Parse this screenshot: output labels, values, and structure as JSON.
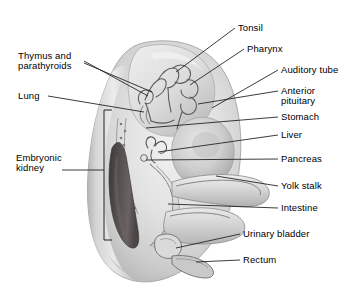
{
  "figure": {
    "background_color": "#ffffff",
    "body_fill_light": "#e8e8e8",
    "body_fill_mid": "#c8c8c8",
    "body_fill_dark": "#9a9a9a",
    "kidney_color": "#4f4a4a",
    "line_color": "#1a1a1a",
    "text_color": "#000000"
  },
  "labels": {
    "tonsil": "Tonsil",
    "pharynx": "Pharynx",
    "auditory_tube": "Auditory tube",
    "anterior_pituitary_line1": "Anterior",
    "anterior_pituitary_line2": "pituitary",
    "stomach": "Stomach",
    "liver": "Liver",
    "pancreas": "Pancreas",
    "yolk_stalk": "Yolk stalk",
    "intestine": "Intestine",
    "urinary_bladder": "Urinary bladder",
    "rectum": "Rectum",
    "thymus_line1": "Thymus and",
    "thymus_line2": "parathyroids",
    "lung": "Lung",
    "embryonic_kidney_line1": "Embryonic",
    "embryonic_kidney_line2": "kidney"
  },
  "annotations": [
    {
      "name": "tonsil",
      "side": "right",
      "text": "Tonsil",
      "x": 239,
      "y": 24
    },
    {
      "name": "pharynx",
      "side": "right",
      "text": "Pharynx",
      "x": 248,
      "y": 45
    },
    {
      "name": "auditory-tube",
      "side": "right",
      "text": "Auditory tube",
      "x": 282,
      "y": 66
    },
    {
      "name": "anterior-pituitary",
      "side": "right",
      "text": "Anterior pituitary",
      "x": 282,
      "y": 87
    },
    {
      "name": "stomach",
      "side": "right",
      "text": "Stomach",
      "x": 282,
      "y": 113
    },
    {
      "name": "liver",
      "side": "right",
      "text": "Liver",
      "x": 282,
      "y": 131
    },
    {
      "name": "pancreas",
      "side": "right",
      "text": "Pancreas",
      "x": 282,
      "y": 155
    },
    {
      "name": "yolk-stalk",
      "side": "right",
      "text": "Yolk stalk",
      "x": 282,
      "y": 182
    },
    {
      "name": "intestine",
      "side": "right",
      "text": "Intestine",
      "x": 282,
      "y": 204
    },
    {
      "name": "urinary-bladder",
      "side": "right",
      "text": "Urinary bladder",
      "x": 244,
      "y": 230
    },
    {
      "name": "rectum",
      "side": "right",
      "text": "Rectum",
      "x": 244,
      "y": 256
    },
    {
      "name": "thymus-and-parathyroids",
      "side": "left",
      "text": "Thymus and parathyroids",
      "x": 18,
      "y": 51
    },
    {
      "name": "lung",
      "side": "left",
      "text": "Lung",
      "x": 18,
      "y": 95
    },
    {
      "name": "embryonic-kidney",
      "side": "left",
      "text": "Embryonic kidney",
      "x": 18,
      "y": 155
    }
  ],
  "structures": [
    {
      "name": "embryo-body",
      "description": "large oval embryo trunk with curved tail"
    },
    {
      "name": "head-region",
      "description": "cephalic bulge at upper area"
    },
    {
      "name": "pharyngeal-pouches",
      "description": "branched pouch structure in head"
    },
    {
      "name": "heart-bulge",
      "description": "rounded liver and heart mass"
    },
    {
      "name": "embryonic-kidney",
      "description": "elongated dark mesonephros"
    },
    {
      "name": "gut-tube",
      "description": "intestinal tube curving to tail"
    },
    {
      "name": "yolk-stalk-tube",
      "description": "tube extending to the right"
    },
    {
      "name": "kidney-bracket",
      "description": "square bracket marking kidney extent"
    }
  ]
}
